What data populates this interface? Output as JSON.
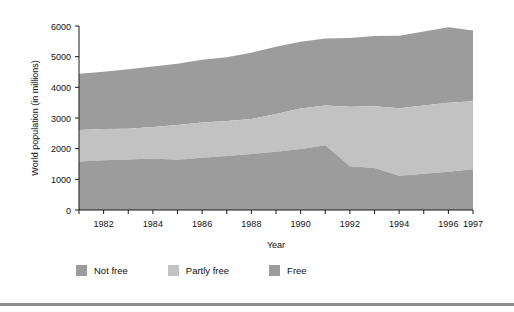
{
  "chart_data": {
    "type": "area",
    "title": "",
    "subtitle": "",
    "xlabel": "Year",
    "ylabel": "World population (in millions)",
    "stacked": true,
    "grid": false,
    "legend_position": "bottom",
    "xlim": [
      1981,
      1997
    ],
    "ylim": [
      0,
      6000
    ],
    "ytick_values": [
      0,
      1000,
      2000,
      3000,
      4000,
      5000,
      6000
    ],
    "ytick_labels": [
      "0",
      "1000",
      "2000",
      "3000",
      "4000",
      "5000",
      "6000"
    ],
    "xtick_values": [
      1982,
      1984,
      1986,
      1988,
      1990,
      1992,
      1994,
      1996,
      1997
    ],
    "xtick_labels": [
      "1982",
      "1984",
      "1986",
      "1988",
      "1990",
      "1992",
      "1994",
      "1996",
      "1997"
    ],
    "x": [
      1981,
      1982,
      1983,
      1984,
      1985,
      1986,
      1987,
      1988,
      1989,
      1990,
      1991,
      1992,
      1993,
      1994,
      1995,
      1996,
      1997
    ],
    "series": [
      {
        "name": "Free",
        "color": "#9c9c9c",
        "values": [
          1580,
          1620,
          1650,
          1680,
          1640,
          1700,
          1760,
          1830,
          1900,
          1990,
          2110,
          1430,
          1370,
          1120,
          1180,
          1250,
          1330
        ]
      },
      {
        "name": "Partly free",
        "color": "#c2c2c2",
        "values": [
          1030,
          1020,
          1000,
          1030,
          1130,
          1150,
          1140,
          1140,
          1230,
          1320,
          1300,
          1940,
          2010,
          2200,
          2230,
          2250,
          2220
        ]
      },
      {
        "name": "Not free",
        "color": "#9c9c9c",
        "values": [
          1830,
          1870,
          1940,
          1970,
          2000,
          2050,
          2080,
          2160,
          2190,
          2180,
          2180,
          2240,
          2290,
          2360,
          2410,
          2460,
          2300
        ]
      }
    ],
    "totals": [
      4440,
      4510,
      4590,
      4680,
      4770,
      4900,
      4980,
      5130,
      5320,
      5490,
      5590,
      5610,
      5670,
      5680,
      5820,
      5960,
      5850
    ]
  },
  "legend": {
    "items": [
      {
        "label": "Not free",
        "color": "#9c9c9c"
      },
      {
        "label": "Partly free",
        "color": "#c2c2c2"
      },
      {
        "label": "Free",
        "color": "#9c9c9c"
      }
    ]
  }
}
